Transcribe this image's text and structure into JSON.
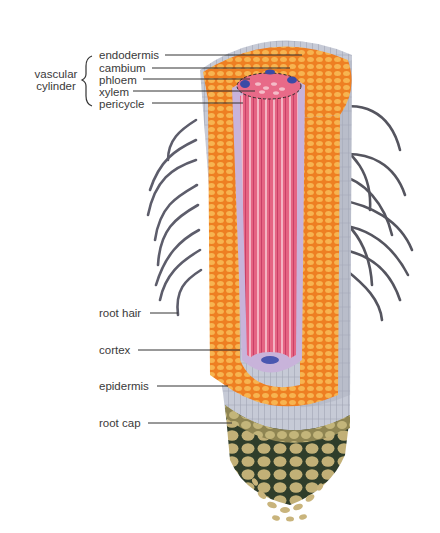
{
  "group": {
    "label_line1": "vascular",
    "label_line2": "cylinder"
  },
  "labels": {
    "endodermis": "endodermis",
    "cambium": "cambium",
    "phloem": "phloem",
    "xylem": "xylem",
    "pericycle": "pericycle",
    "root_hair": "root hair",
    "cortex": "cortex",
    "epidermis": "epidermis",
    "root_cap": "root cap"
  },
  "colors": {
    "cortex": "#f08a2a",
    "cortex_cell": "#f7b64a",
    "xylem": "#e0607c",
    "xylem_light": "#f3a6b8",
    "phloem": "#3d4aa0",
    "pericycle": "#c9b3d9",
    "epidermis": "#c9ccd6",
    "root_hair": "#5a5a66",
    "root_cap": "#b9a86a",
    "root_cap_dark": "#2f3d2a",
    "leader_line": "#333333"
  }
}
